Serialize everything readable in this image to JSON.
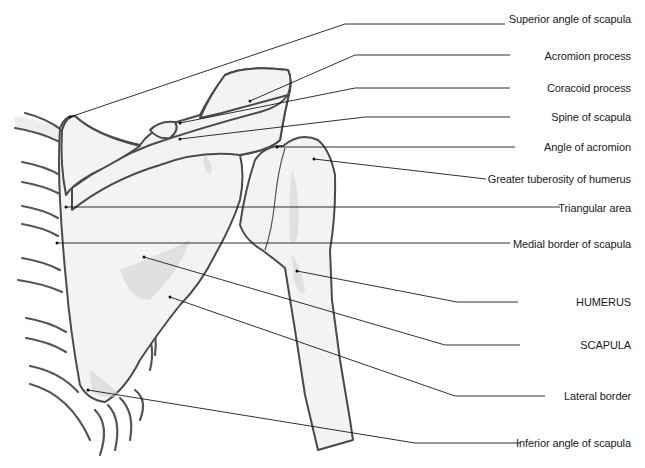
{
  "figure": {
    "type": "anatomical-diagram"
  },
  "labels": [
    {
      "id": "superior-angle",
      "text": "Superior angle of scapula",
      "y": 19
    },
    {
      "id": "acromion-process",
      "text": "Acromion process",
      "y": 56
    },
    {
      "id": "coracoid-process",
      "text": "Coracoid process",
      "y": 88
    },
    {
      "id": "spine-of-scapula",
      "text": "Spine of scapula",
      "y": 117
    },
    {
      "id": "angle-of-acromion",
      "text": "Angle of acromion",
      "y": 146
    },
    {
      "id": "greater-tuberosity",
      "text": "Greater tuberosity of humerus",
      "y": 179
    },
    {
      "id": "triangular-area",
      "text": "Triangular area",
      "y": 208
    },
    {
      "id": "medial-border",
      "text": "Medial border of scapula",
      "y": 245
    },
    {
      "id": "humerus",
      "text": "HUMERUS",
      "y": 302
    },
    {
      "id": "scapula",
      "text": "SCAPULA",
      "y": 345
    },
    {
      "id": "lateral-border",
      "text": "Lateral border",
      "y": 396
    },
    {
      "id": "inferior-angle",
      "text": "Inferior angle of scapula",
      "y": 443
    }
  ],
  "colors": {
    "background": "#ffffff",
    "bone_fill": "#f3f3f3",
    "outline": "#4a4a4a",
    "leader_line": "#1a1a1a",
    "label_text": "#1a1a1a"
  }
}
